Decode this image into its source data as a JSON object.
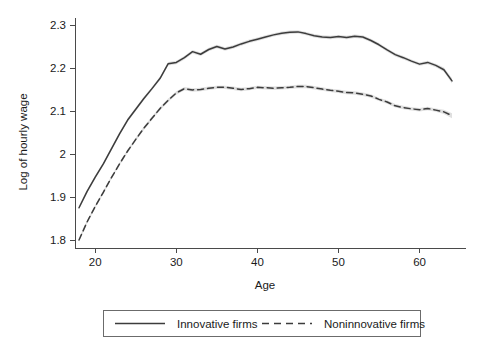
{
  "chart_data": {
    "type": "line",
    "title": "",
    "xlabel": "Age",
    "ylabel": "Log of hourly wage",
    "xlim": [
      17.5,
      64.5
    ],
    "ylim": [
      1.78,
      2.32
    ],
    "xticks": [
      20,
      30,
      40,
      50,
      60
    ],
    "xtick_labels": [
      "20",
      "30",
      "40",
      "50",
      "60"
    ],
    "yticks": [
      1.8,
      1.9,
      2.0,
      2.1,
      2.2,
      2.3
    ],
    "ytick_labels": [
      "1.8",
      "1.9",
      "2",
      "2.1",
      "2.2",
      "2.3"
    ],
    "grid": false,
    "legend_position": "bottom-outside",
    "confidence_band": true,
    "x": [
      18,
      19,
      20,
      21,
      22,
      23,
      24,
      25,
      26,
      27,
      28,
      29,
      30,
      31,
      32,
      33,
      34,
      35,
      36,
      37,
      38,
      39,
      40,
      41,
      42,
      43,
      44,
      45,
      46,
      47,
      48,
      49,
      50,
      51,
      52,
      53,
      54,
      55,
      56,
      57,
      58,
      59,
      60,
      61,
      62,
      63,
      64
    ],
    "series": [
      {
        "name": "Innovative firms",
        "style": "solid",
        "color": "#3c3c3c",
        "values": [
          1.875,
          1.913,
          1.946,
          1.977,
          2.012,
          2.047,
          2.079,
          2.104,
          2.129,
          2.152,
          2.176,
          2.21,
          2.213,
          2.224,
          2.238,
          2.232,
          2.243,
          2.25,
          2.244,
          2.249,
          2.256,
          2.262,
          2.267,
          2.272,
          2.277,
          2.281,
          2.283,
          2.284,
          2.28,
          2.275,
          2.272,
          2.271,
          2.273,
          2.271,
          2.274,
          2.272,
          2.264,
          2.254,
          2.242,
          2.231,
          2.224,
          2.216,
          2.209,
          2.213,
          2.206,
          2.196,
          2.17
        ],
        "band_halfwidth": [
          0.004,
          0.004,
          0.004,
          0.004,
          0.004,
          0.004,
          0.004,
          0.004,
          0.004,
          0.004,
          0.004,
          0.004,
          0.004,
          0.004,
          0.004,
          0.004,
          0.004,
          0.004,
          0.004,
          0.004,
          0.004,
          0.004,
          0.004,
          0.004,
          0.004,
          0.004,
          0.004,
          0.004,
          0.004,
          0.004,
          0.004,
          0.004,
          0.004,
          0.004,
          0.004,
          0.004,
          0.004,
          0.004,
          0.004,
          0.004,
          0.004,
          0.004,
          0.004,
          0.004,
          0.004,
          0.005,
          0.006
        ]
      },
      {
        "name": "Noninnovative firms",
        "style": "dashed",
        "color": "#3c3c3c",
        "values": [
          1.8,
          1.842,
          1.878,
          1.911,
          1.945,
          1.977,
          2.007,
          2.034,
          2.06,
          2.083,
          2.106,
          2.125,
          2.142,
          2.152,
          2.149,
          2.15,
          2.153,
          2.155,
          2.155,
          2.153,
          2.15,
          2.152,
          2.155,
          2.154,
          2.153,
          2.154,
          2.155,
          2.157,
          2.157,
          2.154,
          2.151,
          2.148,
          2.146,
          2.143,
          2.142,
          2.139,
          2.135,
          2.127,
          2.121,
          2.112,
          2.108,
          2.105,
          2.103,
          2.106,
          2.102,
          2.098,
          2.089
        ],
        "band_halfwidth": [
          0.004,
          0.004,
          0.004,
          0.004,
          0.004,
          0.004,
          0.004,
          0.004,
          0.004,
          0.004,
          0.004,
          0.004,
          0.004,
          0.004,
          0.004,
          0.004,
          0.004,
          0.004,
          0.004,
          0.004,
          0.004,
          0.004,
          0.004,
          0.004,
          0.004,
          0.004,
          0.004,
          0.004,
          0.004,
          0.004,
          0.004,
          0.004,
          0.004,
          0.004,
          0.004,
          0.004,
          0.004,
          0.004,
          0.004,
          0.004,
          0.004,
          0.004,
          0.004,
          0.004,
          0.004,
          0.005,
          0.006
        ]
      }
    ]
  },
  "legend": {
    "entries": [
      {
        "label": "Innovative firms",
        "style": "solid"
      },
      {
        "label": "Noninnovative firms",
        "style": "dashed"
      }
    ]
  },
  "colors": {
    "line": "#3c3c3c",
    "band": "#d9d9d9",
    "axis": "#4a4a4a",
    "text": "#1a1a1a",
    "background": "#ffffff"
  }
}
